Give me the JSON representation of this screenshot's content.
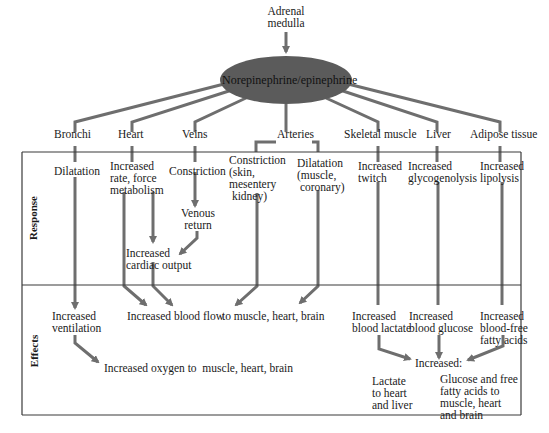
{
  "diagram": {
    "source": "Adrenal\nmedulla",
    "hormone": "Norepinephrine/epinephrine",
    "colors": {
      "line": "#6e6e6e",
      "ellipse": "#5b5b5b",
      "border": "#3a3a3a",
      "text": "#1a1a1a"
    },
    "section_labels": {
      "response": "Response",
      "effects": "Effects"
    },
    "targets": {
      "bronchi": "Bronchi",
      "heart": "Heart",
      "veins": "Veins",
      "arteries": "Arteries",
      "skeletal_muscle": "Skeletal muscle",
      "liver": "Liver",
      "adipose": "Adipose tissue"
    },
    "responses": {
      "bronchi": "Dilatation",
      "heart": "Increased\nrate, force\nmetabolism",
      "veins": "Constriction",
      "arteries_constriction": "Constriction\n(skin,\nmesentery\n kidney)",
      "arteries_dilatation": "Dilatation\n(muscle,\n coronary)",
      "skeletal_muscle": "Increased\ntwitch",
      "liver": "Increased\nglycogenolysis",
      "adipose": "Increased\nlipolysis",
      "venous_return": "Venous\nreturn",
      "cardiac_output": "Increased\ncardiac output"
    },
    "effects": {
      "ventilation": "Increased\nventilation",
      "blood_flow": "Increased blood flow",
      "blood_flow_target": "to muscle, heart, brain",
      "oxygen": "Increased oxygen to  muscle, heart, brain",
      "blood_lactate": "Increased\nblood lactate",
      "blood_glucose": "Increased\nblood glucose",
      "fatty_acids": "Increased\nblood-free\nfatty acids",
      "increased": "Increased:",
      "lactate_dest": "Lactate\nto heart\nand liver",
      "glucose_dest": "Glucose and free\nfatty acids to\nmuscle, heart\nand brain"
    }
  }
}
